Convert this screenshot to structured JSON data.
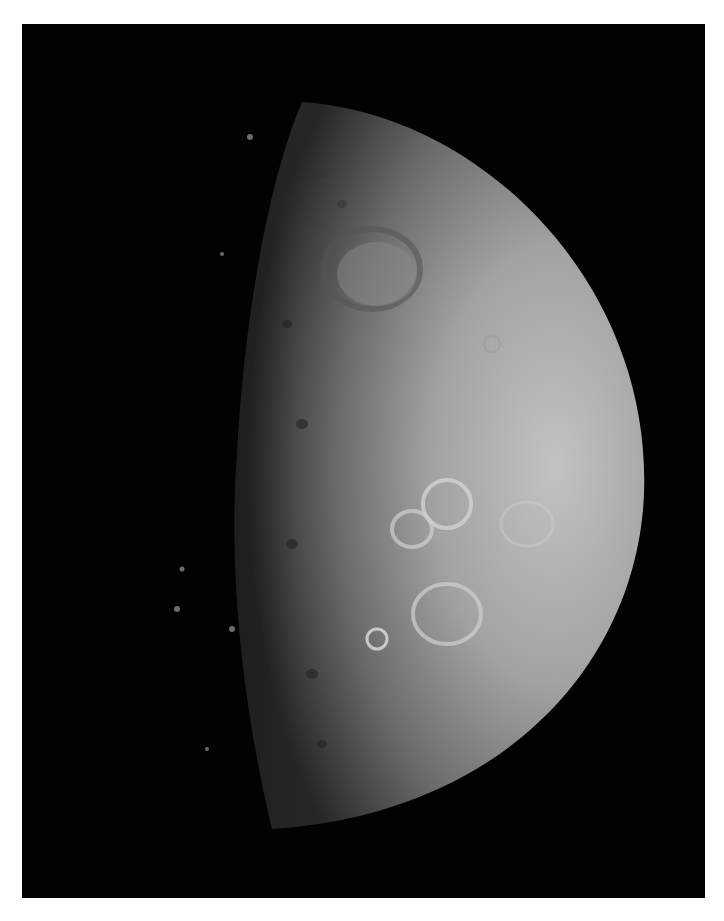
{
  "image": {
    "subject": "crescent-gibbous moon with cratered surface",
    "background_color": "#020202",
    "border_color": "#ffffff",
    "surface_colors": {
      "bright": "#bdbdbd",
      "mid": "#8a8a8a",
      "terminator": "#2a2a2a"
    }
  }
}
